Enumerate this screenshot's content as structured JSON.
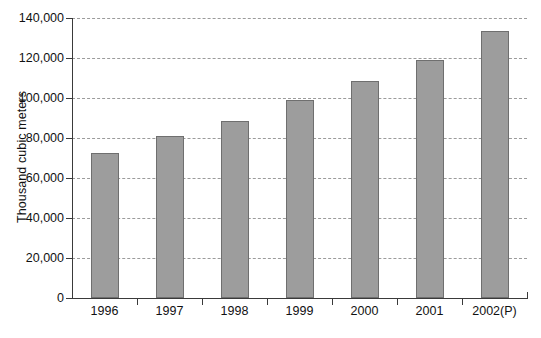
{
  "chart_data": {
    "type": "bar",
    "title": "",
    "subtitle": "",
    "xlabel": "",
    "ylabel": "Thousand cubic meters",
    "categories": [
      "1996",
      "1997",
      "1998",
      "1999",
      "2000",
      "2001",
      "2002(P)"
    ],
    "values": [
      72650,
      80950,
      88750,
      98850,
      108650,
      118950,
      133500
    ],
    "series": [
      {
        "name": "Production",
        "values": [
          72650,
          80950,
          88750,
          98850,
          108650,
          118950,
          133500
        ]
      }
    ],
    "ylim": [
      0,
      140000
    ],
    "ytick_values": [
      0,
      20000,
      40000,
      60000,
      80000,
      100000,
      120000,
      140000
    ],
    "ytick_labels": [
      "0",
      "20,000",
      "40,000",
      "60,000",
      "80,000",
      "100,000",
      "120,000",
      "140,000"
    ],
    "grid": true,
    "gridline_style": "dashed",
    "legend": false,
    "legend_position": "none",
    "bar_fill_color": "#9d9d9d",
    "bar_border_color": "#6f6f6f",
    "grid_color": "#9b9b9b",
    "axis_color": "#3a3a3a",
    "background_color": "#ffffff"
  },
  "caption": {
    "partial_text": ""
  }
}
